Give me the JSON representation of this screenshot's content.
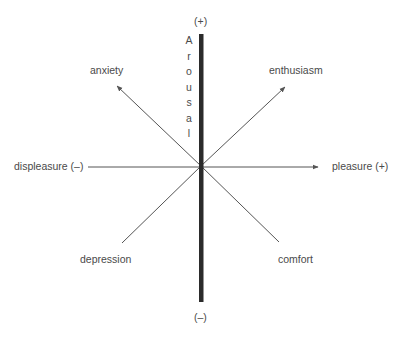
{
  "diagram": {
    "vertical_axis": {
      "label": "Arousal",
      "letters": [
        "A",
        "r",
        "o",
        "u",
        "s",
        "a",
        "l"
      ],
      "top_label": "(+)",
      "bottom_label": "(–)"
    },
    "horizontal_axis": {
      "left_label": "displeasure (–)",
      "right_label": "pleasure (+)"
    },
    "diagonals": {
      "upper_left": "anxiety",
      "upper_right": "enthusiasm",
      "lower_left": "depression",
      "lower_right": "comfort"
    },
    "colors": {
      "vertical_axis": "#2b2b2b",
      "lines": "#555555",
      "text": "#4a4a4a"
    }
  }
}
